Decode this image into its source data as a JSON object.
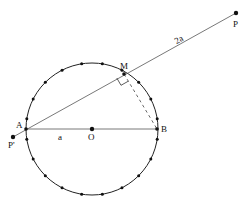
{
  "diagram": {
    "type": "geometry",
    "colors": {
      "line": "#555555",
      "circle": "#222222",
      "dot": "#111111",
      "background": "#ffffff"
    },
    "circle": {
      "cx": 92,
      "cy": 129,
      "r": 66,
      "dot_count": 20
    },
    "points": {
      "P": {
        "label": "P",
        "x": 236,
        "y": 13
      },
      "M": {
        "label": "M",
        "x": 124,
        "y": 74
      },
      "A": {
        "label": "A",
        "x": 26,
        "y": 129
      },
      "B": {
        "label": "B",
        "x": 157,
        "y": 129
      },
      "O": {
        "label": "O",
        "x": 92,
        "y": 129
      },
      "Pp": {
        "label": "P'",
        "x": 13,
        "y": 137
      }
    },
    "segment_labels": {
      "AO": "a",
      "MP": "2a"
    }
  }
}
